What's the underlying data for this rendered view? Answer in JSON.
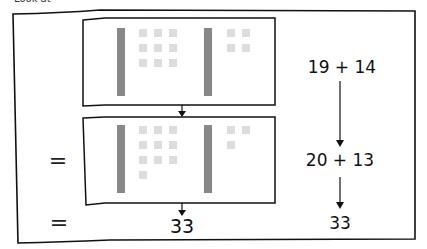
{
  "header": {
    "clipped_text": "Look at"
  },
  "colors": {
    "frame": "#111111",
    "rod": "#888888",
    "unit": "#dddddd",
    "background": "#ffffff"
  },
  "top_box": {
    "left_group": {
      "tens": 1,
      "ones": 9,
      "value": 19
    },
    "right_group": {
      "tens": 1,
      "ones": 4,
      "value": 14
    }
  },
  "bottom_box": {
    "left_group": {
      "tens": 1,
      "ones": 10,
      "value": 20
    },
    "right_group": {
      "tens": 1,
      "ones": 3,
      "value": 13
    }
  },
  "left_column": {
    "equals_1": "=",
    "equals_2": "=",
    "result": "33"
  },
  "right_column": {
    "step_1": "19 + 14",
    "step_2": "20 + 13",
    "result": "33"
  }
}
